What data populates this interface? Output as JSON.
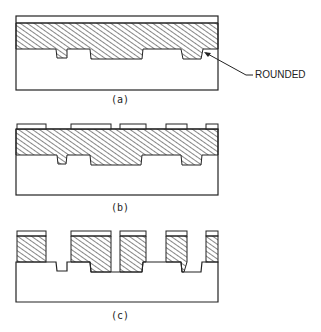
{
  "figure": {
    "panels": [
      {
        "id": "a",
        "label": "(a)",
        "description": "Hatched layer over substrate with thin top film; bottom of layer follows etched steps"
      },
      {
        "id": "b",
        "label": "(b)",
        "description": "Patterned mask segments on top of hatched layer"
      },
      {
        "id": "c",
        "label": "(c)",
        "description": "Layer etched through openings leaving hatched columns with mask caps"
      }
    ],
    "annotation": {
      "text": "ROUNDED",
      "points_to": "rounded corner in panel (a)"
    },
    "colors": {
      "line": "#222222",
      "background": "#ffffff"
    }
  }
}
